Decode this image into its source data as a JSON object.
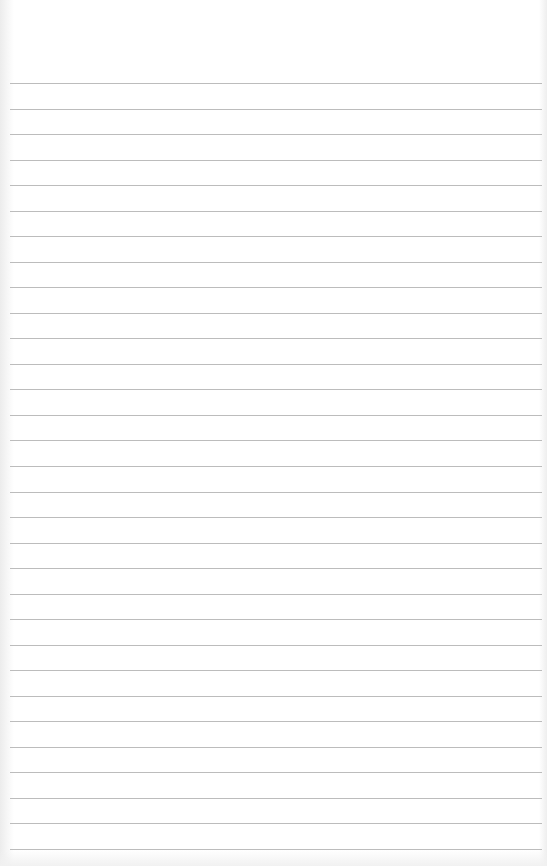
{
  "page": {
    "type": "lined-notepaper",
    "background_color": "#ffffff",
    "line_color": "#bcbcbc",
    "line_count": 31,
    "first_line_y": 83,
    "last_line_y": 849,
    "line_left_x": 10,
    "line_right_x": 542,
    "text": ""
  }
}
